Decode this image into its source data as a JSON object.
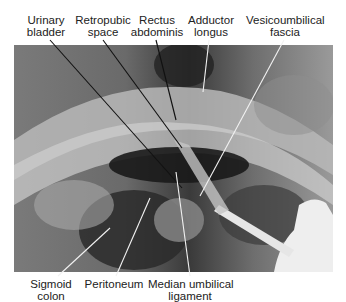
{
  "figure": {
    "type": "anatomical-photograph",
    "style": "grayscale cadaver dissection photo with leader-line labels",
    "top_labels": [
      {
        "id": "urinary-bladder",
        "line1": "Urinary",
        "line2": "bladder"
      },
      {
        "id": "retropubic-space",
        "line1": "Retropubic",
        "line2": "space"
      },
      {
        "id": "rectus-abdominis",
        "line1": "Rectus",
        "line2": "abdominis"
      },
      {
        "id": "adductor-longus",
        "line1": "Adductor",
        "line2": "longus"
      },
      {
        "id": "vesicoumbilical-fascia",
        "line1": "Vesicoumbilical",
        "line2": "fascia"
      }
    ],
    "bottom_labels": [
      {
        "id": "sigmoid-colon",
        "line1": "Sigmoid",
        "line2": "colon"
      },
      {
        "id": "peritoneum",
        "line1": "Peritoneum",
        "line2": ""
      },
      {
        "id": "median-umbilical-ligament",
        "line1": "Median umbilical",
        "line2": "ligament"
      }
    ],
    "colors": {
      "background": "#ffffff",
      "text": "#222222",
      "leader_line_dark": "#111111",
      "leader_line_light": "#f2f2f2"
    }
  }
}
